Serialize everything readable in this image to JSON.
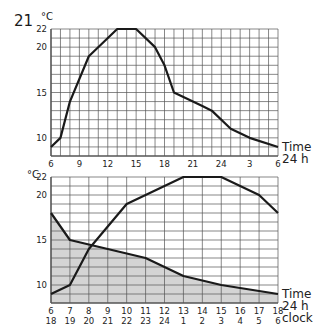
{
  "figure_number": "21",
  "chart_data": [
    {
      "type": "line",
      "title": "",
      "unit_label": "°C",
      "xlabel": "Time 24 h",
      "xlabel_lines": [
        "Time",
        "24 h"
      ],
      "ylabel": "°C",
      "ylim": [
        8,
        22
      ],
      "y_ticks": [
        10,
        15,
        20,
        22
      ],
      "x_tick_labels": [
        "6",
        "9",
        "12",
        "15",
        "18",
        "21",
        "24",
        "3",
        "6"
      ],
      "x_hours_from_start": [
        0,
        3,
        6,
        9,
        12,
        15,
        18,
        21,
        24
      ],
      "grid": true,
      "series": [
        {
          "name": "Daily temperature curve",
          "x_hours_from_6": [
            0,
            1,
            2,
            4,
            7,
            9,
            11,
            12,
            13,
            16,
            17,
            19,
            21,
            24
          ],
          "values": [
            9,
            10,
            14,
            19,
            22,
            22,
            20,
            18,
            15,
            13.5,
            13,
            11,
            10,
            9
          ]
        }
      ]
    },
    {
      "type": "area",
      "title": "",
      "unit_label": "°C",
      "xlabel": "Time 24 h clock",
      "xlabel_lines": [
        "Time",
        "24 h",
        "clock"
      ],
      "ylabel": "°C",
      "ylim": [
        8,
        22
      ],
      "y_ticks": [
        10,
        15,
        20,
        22
      ],
      "x_tick_labels_row1": [
        "6",
        "7",
        "8",
        "9",
        "10",
        "11",
        "12",
        "13",
        "14",
        "15",
        "16",
        "17",
        "18"
      ],
      "x_tick_labels_row2": [
        "18",
        "19",
        "20",
        "21",
        "22",
        "23",
        "24",
        "1",
        "2",
        "3",
        "4",
        "5",
        "6"
      ],
      "grid": true,
      "series": [
        {
          "name": "Daytime (6–18 h) rising curve",
          "x_index": [
            0,
            1,
            2,
            4,
            7,
            9,
            11,
            12
          ],
          "values": [
            9,
            10,
            14,
            19,
            22,
            22,
            20,
            18
          ],
          "filled": false
        },
        {
          "name": "Night-time (18–6 h) falling curve, shaded",
          "x_index": [
            0,
            1,
            3,
            5,
            7,
            9,
            12
          ],
          "values": [
            18,
            15,
            14,
            13,
            11,
            10,
            9
          ],
          "filled": true
        }
      ]
    }
  ]
}
